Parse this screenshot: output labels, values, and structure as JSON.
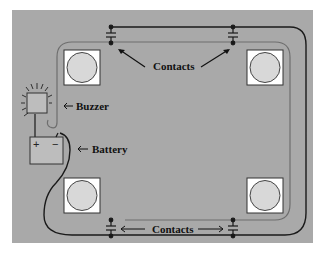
{
  "diagram": {
    "labels": {
      "contacts_top": "Contacts",
      "contacts_bottom": "Contacts",
      "buzzer": "Buzzer",
      "battery": "Battery"
    },
    "battery_terminals": {
      "positive": "+",
      "negative": "−"
    },
    "colors": {
      "panel": "#a9a9a9",
      "pad_fill": "#ffffff",
      "disc_fill": "#d8d8d8",
      "wire": "#1a1a1a",
      "inner_track": "#6e6e6e"
    }
  }
}
